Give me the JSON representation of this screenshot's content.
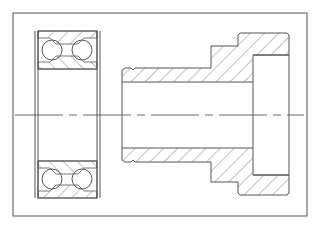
{
  "drawing": {
    "type": "mechanical-section-drawing",
    "colors": {
      "line": "#555555",
      "hatch": "#666666",
      "background": "#ffffff"
    },
    "frame": {
      "x": 13,
      "y": 13,
      "width": 294,
      "height": 203
    },
    "centerline": {
      "y": 115,
      "x1": 15,
      "x2": 304,
      "style": "dash-dot"
    },
    "parts": [
      {
        "name": "double-row ball bearing",
        "view": "section",
        "balls_per_row": 2,
        "rows_shown": [
          "top",
          "bottom"
        ]
      },
      {
        "name": "stepped flanged bushing",
        "view": "section",
        "features": [
          "bore",
          "shaft",
          "shoulder",
          "flange",
          "counterbore"
        ]
      }
    ]
  }
}
